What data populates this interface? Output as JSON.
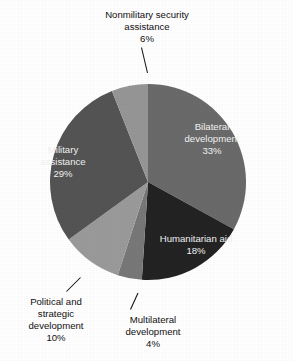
{
  "chart_data": {
    "type": "pie",
    "title": "",
    "xlabel": "",
    "ylabel": "",
    "unit": "%",
    "legend_position": "none",
    "grid": false,
    "start_angle_deg": 0,
    "direction": "clockwise",
    "categories": [
      "Bilateral development",
      "Humanitarian aid",
      "Multilateral development",
      "Political and strategic development",
      "Military assistance",
      "Nonmilitary security assistance"
    ],
    "values": [
      33,
      18,
      4,
      10,
      29,
      6
    ],
    "slices": [
      {
        "name": "bilateral-development",
        "label_line_1": "Bilateral",
        "label_line_2": "development",
        "value_label": "33%",
        "value": 33,
        "color": "#6a6a6a",
        "label_placement": "inside"
      },
      {
        "name": "humanitarian-aid",
        "label_line_1": "Humanitarian aid",
        "label_line_2": "",
        "value_label": "18%",
        "value": 18,
        "color": "#232323",
        "label_placement": "inside"
      },
      {
        "name": "multilateral-development",
        "label_line_1": "Multilateral",
        "label_line_2": "development",
        "value_label": "4%",
        "value": 4,
        "color": "#787878",
        "label_placement": "outside"
      },
      {
        "name": "political-and-strategic-development",
        "label_line_1": "Political and",
        "label_line_2": "strategic",
        "label_line_3": "development",
        "value_label": "10%",
        "value": 10,
        "color": "#9a9a9a",
        "label_placement": "outside"
      },
      {
        "name": "military-assistance",
        "label_line_1": "Military",
        "label_line_2": "assistance",
        "value_label": "29%",
        "value": 29,
        "color": "#545454",
        "label_placement": "inside"
      },
      {
        "name": "nonmilitary-security-assistance",
        "label_line_1": "Nonmilitary security",
        "label_line_2": "assistance",
        "value_label": "6%",
        "value": 6,
        "color": "#969696",
        "label_placement": "outside"
      }
    ]
  },
  "labels": {
    "bilateral_l1": "Bilateral",
    "bilateral_l2": "development",
    "bilateral_pct": "33%",
    "humanitarian_l1": "Humanitarian aid",
    "humanitarian_pct": "18%",
    "multilateral_l1": "Multilateral",
    "multilateral_l2": "development",
    "multilateral_pct": "4%",
    "political_l1": "Political and",
    "political_l2": "strategic",
    "political_l3": "development",
    "political_pct": "10%",
    "military_l1": "Military",
    "military_l2": "assistance",
    "military_pct": "29%",
    "nonmilitary_l1": "Nonmilitary security",
    "nonmilitary_l2": "assistance",
    "nonmilitary_pct": "6%"
  },
  "colors": {
    "background": "#ffffff",
    "text": "#111111",
    "inner_text": "#f2f2f2",
    "bilateral": "#6a6a6a",
    "humanitarian": "#232323",
    "multilateral": "#787878",
    "political": "#9a9a9a",
    "military": "#545454",
    "nonmilitary": "#969696"
  }
}
